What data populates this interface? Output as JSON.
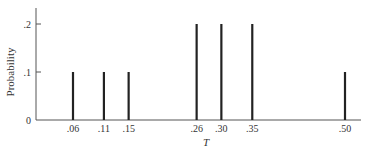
{
  "chart_data": {
    "type": "bar",
    "subtype": "stem / probability mass function",
    "title": "",
    "xlabel": "T",
    "ylabel": "Probability",
    "categories": [
      ".06",
      ".11",
      ".15",
      ".26",
      ".30",
      ".35",
      ".50"
    ],
    "x": [
      0.06,
      0.11,
      0.15,
      0.26,
      0.3,
      0.35,
      0.5
    ],
    "values": [
      0.1,
      0.1,
      0.1,
      0.2,
      0.2,
      0.2,
      0.1
    ],
    "y_ticks": [
      "0",
      ".1",
      ".2"
    ],
    "y_tick_values": [
      0,
      0.1,
      0.2
    ],
    "ylim": [
      0,
      0.23
    ],
    "grid": false,
    "legend": null
  },
  "labels": {
    "ylabel": "Probability",
    "xlabel": "T",
    "y_ticks": [
      "0",
      ".1",
      ".2"
    ]
  }
}
